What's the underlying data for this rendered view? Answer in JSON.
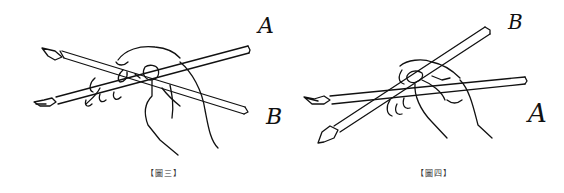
{
  "figures": [
    {
      "id": "fig3",
      "caption": "【圖三】",
      "labels": {
        "upper": "A",
        "lower": "B"
      },
      "description": "Hand holding two crossed brushes; brush A tip at upper-left, brush B tip at lower-left"
    },
    {
      "id": "fig4",
      "caption": "【圖四】",
      "labels": {
        "upper": "B",
        "lower": "A"
      },
      "description": "Hand holding two crossed brushes; brush B angled steeply to upper-right, brush A near-horizontal"
    }
  ],
  "colors": {
    "ink": "#111111",
    "background": "#ffffff",
    "caption": "#333333"
  }
}
